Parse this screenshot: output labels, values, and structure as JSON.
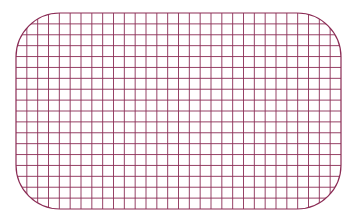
{
  "figure": {
    "type": "rounded-rectangle-grid",
    "background": "#ffffff",
    "stroke_color": "#8b2c55",
    "shape": {
      "x": 16,
      "y": 13,
      "width": 325,
      "height": 196,
      "corner_radius": 44
    },
    "grid": {
      "columns": 30,
      "rows": 18,
      "cell_size": 10.83
    }
  }
}
